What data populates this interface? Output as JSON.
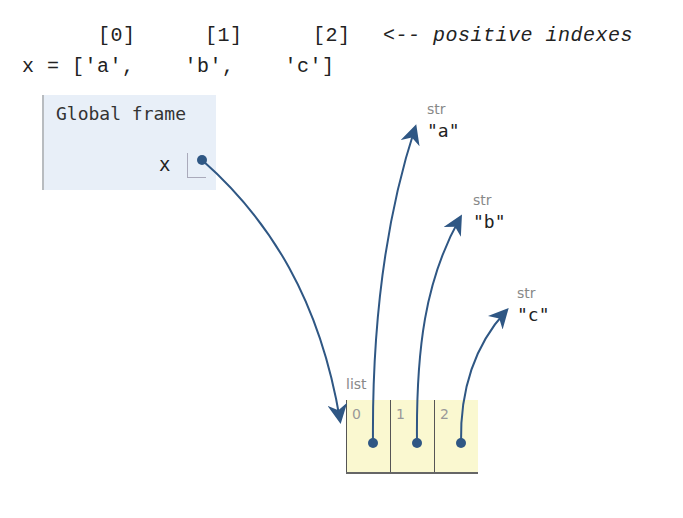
{
  "code": {
    "index_line": {
      "labels": [
        "[0]",
        "[1]",
        "[2]"
      ],
      "annotation": "<-- positive indexes"
    },
    "assign_line": "x = ['a',    'b',    'c']"
  },
  "global_frame": {
    "title": "Global frame",
    "variables": [
      {
        "name": "x",
        "points_to": "list"
      }
    ]
  },
  "list_object": {
    "type_label": "list",
    "cells": [
      {
        "index": "0",
        "points_to": "str_a"
      },
      {
        "index": "1",
        "points_to": "str_b"
      },
      {
        "index": "2",
        "points_to": "str_c"
      }
    ]
  },
  "strings": [
    {
      "id": "str_a",
      "type_label": "str",
      "value": "\"a\""
    },
    {
      "id": "str_b",
      "type_label": "str",
      "value": "\"b\""
    },
    {
      "id": "str_c",
      "type_label": "str",
      "value": "\"c\""
    }
  ],
  "colors": {
    "arrow": "#2f5784",
    "frame_bg": "#e8eff8",
    "list_bg": "#faf8d0"
  }
}
